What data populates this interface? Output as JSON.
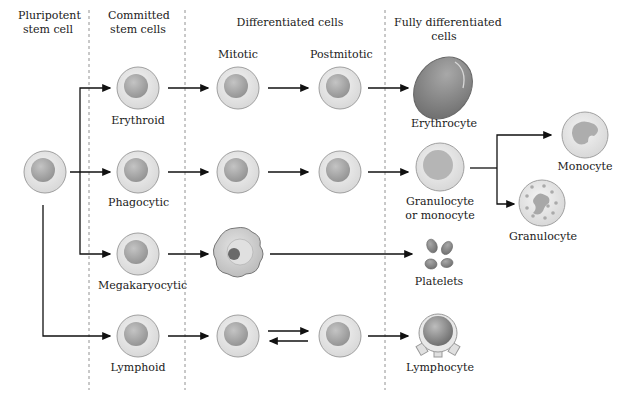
{
  "diagram": {
    "column_headers": [
      {
        "id": "pluripotent",
        "line1": "Pluripotent",
        "line2": "stem cell"
      },
      {
        "id": "committed",
        "line1": "Committed",
        "line2": "stem cells"
      },
      {
        "id": "differentiated",
        "line1": "Differentiated cells",
        "line2": ""
      },
      {
        "id": "fully",
        "line1": "Fully differentiated",
        "line2": "cells"
      }
    ],
    "sub_headers": {
      "mitotic": "Mitotic",
      "postmitotic": "Postmitotic"
    },
    "rows": [
      {
        "committed": "Erythroid",
        "final_line1": "Erythrocyte",
        "final_line2": ""
      },
      {
        "committed": "Phagocytic",
        "final_line1": "Granulocyte",
        "final_line2": "or monocyte"
      },
      {
        "committed": "Megakaryocytic",
        "final_line1": "Platelets",
        "final_line2": ""
      },
      {
        "committed": "Lymphoid",
        "final_line1": "Lymphocyte",
        "final_line2": ""
      }
    ],
    "branch_outputs": [
      {
        "label": "Monocyte"
      },
      {
        "label": "Granulocyte"
      }
    ],
    "colors": {
      "cell_outer": "#e6e6e6",
      "cell_outer_stroke": "#9a9a9a",
      "nucleus": "#a8a8a8",
      "erythrocyte": "#8a8a8a",
      "arrow": "#111111",
      "divider": "#777777"
    }
  }
}
